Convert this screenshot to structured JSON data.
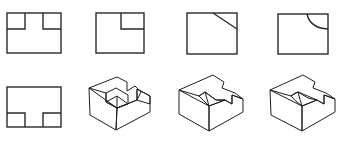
{
  "figure": {
    "colors": {
      "line": "#2a2a2a",
      "background": "#ffffff",
      "shade_light": "#d8d8d8",
      "shade_mid": "#a8a8a8",
      "shade_dark": "#6e6e6e"
    },
    "top_row": [
      {
        "id": "view-1",
        "feature": "two-corner-notches"
      },
      {
        "id": "view-2",
        "feature": "one-corner-notch"
      },
      {
        "id": "view-3",
        "feature": "chamfer-corner"
      },
      {
        "id": "view-4",
        "feature": "rounded-corner-cut"
      }
    ],
    "bottom_row": [
      {
        "id": "front-view",
        "feature": "t-shape-bottom-notches"
      },
      {
        "id": "solid-1",
        "feature": "stepped-block-with-square-notch"
      },
      {
        "id": "solid-2",
        "feature": "stepped-block-with-chamfer"
      },
      {
        "id": "solid-3",
        "feature": "stepped-block-with-curved-cut"
      }
    ]
  }
}
